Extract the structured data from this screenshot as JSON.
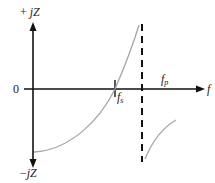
{
  "diagram": {
    "axes": {
      "y_top_label_sign": "+",
      "y_top_label": "jZ",
      "y_bottom_label_sign": "−",
      "y_bottom_label": "jZ",
      "origin_label": "0",
      "x_label": "f"
    },
    "markers": {
      "series_resonance": {
        "base": "f",
        "sub": "s"
      },
      "parallel_resonance": {
        "base": "f",
        "sub": "p"
      }
    },
    "colors": {
      "axis": "#111111",
      "curve": "#a6a6a6",
      "asymptote": "#111111"
    }
  }
}
